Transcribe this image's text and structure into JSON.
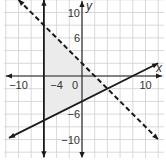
{
  "chart_data": {
    "type": "line",
    "title": "",
    "xlabel": "x",
    "ylabel": "y",
    "xlim": [
      -12,
      12
    ],
    "ylim": [
      -12,
      12
    ],
    "grid": true,
    "grid_step": 2,
    "x_tick_labels": [
      {
        "value": -10,
        "label": "−10"
      },
      {
        "value": -4,
        "label": "−4"
      },
      {
        "value": 0,
        "label": "0"
      },
      {
        "value": 10,
        "label": "10"
      }
    ],
    "y_tick_labels": [
      {
        "value": 10,
        "label": "10"
      },
      {
        "value": 6,
        "label": "6"
      },
      {
        "value": -6,
        "label": "−6"
      },
      {
        "value": -10,
        "label": "−10"
      }
    ],
    "series": [
      {
        "name": "dashed boundary",
        "equation": "y = -x + 2",
        "style": "dashed",
        "x": [
          -10,
          12
        ],
        "y": [
          12,
          -10
        ]
      },
      {
        "name": "solid boundary",
        "equation": "y = 0.5x - 4",
        "style": "solid",
        "x": [
          -11.5,
          12
        ],
        "y": [
          -9.75,
          2
        ]
      },
      {
        "name": "vertical boundary",
        "equation": "x = -6",
        "style": "solid",
        "x": [
          -6,
          -6
        ],
        "y": [
          12,
          -12.8
        ]
      }
    ],
    "shaded_region": {
      "description": "feasible region of the system of inequalities",
      "vertices": [
        [
          -6,
          8
        ],
        [
          -6,
          -7
        ],
        [
          4,
          -2
        ]
      ],
      "color": "#ebebeb"
    },
    "colors": {
      "lines": "#1a1a1a",
      "grid": "#cfcfcf",
      "shade": "#ebebeb"
    }
  }
}
